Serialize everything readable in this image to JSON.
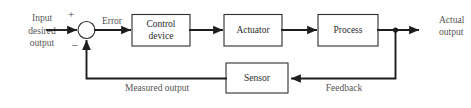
{
  "diagram": {
    "type": "block-diagram",
    "colors": {
      "background": "#ffffff",
      "wire": "#1d1d1d",
      "box_stroke": "#2f2f2f",
      "box_fill": "#ffffff",
      "block_text": "#2b2b2b",
      "signal_text": "#555555"
    },
    "inputs": {
      "input_line_1": "Input",
      "input_line_2": "desired",
      "input_line_3": "output"
    },
    "outputs": {
      "output_line_1": "Actual",
      "output_line_2": "output"
    },
    "summing_junction": {
      "plus_sign": "+",
      "minus_sign": "–"
    },
    "blocks": [
      {
        "id": "control-device",
        "line1": "Control",
        "line2": "device"
      },
      {
        "id": "actuator",
        "line1": "Actuator",
        "line2": ""
      },
      {
        "id": "process",
        "line1": "Process",
        "line2": ""
      },
      {
        "id": "sensor",
        "line1": "Sensor",
        "line2": ""
      }
    ],
    "signals": {
      "error": "Error",
      "measured_output": "Measured output",
      "feedback": "Feedback"
    }
  }
}
